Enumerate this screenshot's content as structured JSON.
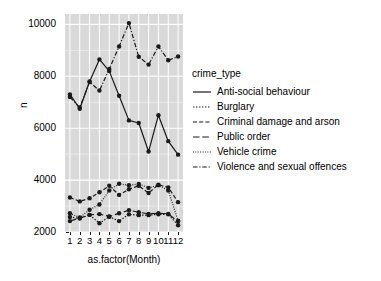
{
  "chart_data": {
    "type": "line",
    "title": "",
    "xlabel": "as.factor(Month)",
    "ylabel": "n",
    "categories": [
      "1",
      "2",
      "3",
      "4",
      "5",
      "6",
      "7",
      "8",
      "9",
      "10",
      "11",
      "12"
    ],
    "x": [
      1,
      2,
      3,
      4,
      5,
      6,
      7,
      8,
      9,
      10,
      11,
      12
    ],
    "ylim": [
      2000,
      10400
    ],
    "yticks": [
      2000,
      4000,
      6000,
      8000,
      10000
    ],
    "ytick_labels": [
      "2000",
      "4000",
      "6000",
      "8000",
      "10000"
    ],
    "grid": true,
    "legend_position": "right",
    "legend_title": "crime_type",
    "series": [
      {
        "name": "Anti-social behaviour",
        "dash": "solid",
        "values": [
          7300,
          6750,
          7800,
          8650,
          8200,
          7250,
          6300,
          6200,
          5100,
          6500,
          5500,
          4980
        ]
      },
      {
        "name": "Burglary",
        "dash": "dotted",
        "values": [
          2580,
          2520,
          2660,
          2340,
          2590,
          2420,
          2680,
          2650,
          2650,
          2680,
          2680,
          2260
        ]
      },
      {
        "name": "Criminal damage and arson",
        "dash": "dashed",
        "values": [
          3330,
          3180,
          3300,
          3530,
          3780,
          3430,
          3650,
          3780,
          3500,
          3820,
          3720,
          3150
        ]
      },
      {
        "name": "Public order",
        "dash": "longdash",
        "values": [
          2420,
          2540,
          2660,
          2690,
          2600,
          2720,
          2840,
          2760,
          2700,
          2720,
          2700,
          2400
        ]
      },
      {
        "name": "Vehicle crime",
        "dash": "fine-dotted",
        "values": [
          2720,
          2560,
          2860,
          3060,
          3600,
          3860,
          3800,
          3850,
          3700,
          3800,
          3600,
          2440
        ]
      },
      {
        "name": "Violence and sexual offences",
        "dash": "dash-dot",
        "values": [
          7200,
          6800,
          7780,
          7450,
          8280,
          9150,
          10050,
          8750,
          8450,
          9150,
          8620,
          8760
        ]
      }
    ],
    "lower_series_detail": {
      "note": "Burglary, Public order and Vehicle crime overlap near 2200-3900",
      "marker": "filled-circle",
      "line_color": "#1a1a1a"
    }
  },
  "axes": {
    "y_title": "n",
    "x_title": "as.factor(Month)"
  },
  "legend": {
    "title": "crime_type",
    "items": [
      {
        "label": "Anti-social behaviour"
      },
      {
        "label": "Burglary"
      },
      {
        "label": "Criminal damage and arson"
      },
      {
        "label": "Public order"
      },
      {
        "label": "Vehicle crime"
      },
      {
        "label": "Violence and sexual offences"
      }
    ]
  },
  "colors": {
    "panel_background": "#d9d9d9",
    "gridline_major": "#ffffff",
    "gridline_minor": "#f0f0f0",
    "line": "#1a1a1a",
    "text": "#000000",
    "page_background": "#ffffff"
  }
}
